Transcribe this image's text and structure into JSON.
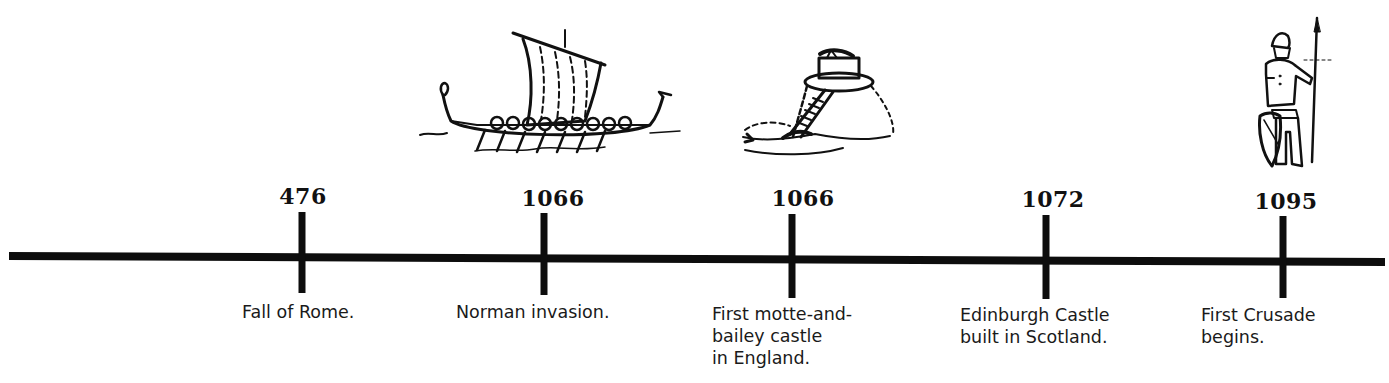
{
  "timeline": {
    "axis_color": "#0d0d0d",
    "events": [
      {
        "year": "476",
        "label": "Fall of Rome.",
        "illustration": null
      },
      {
        "year": "1066",
        "label": "Norman invasion.",
        "illustration": "viking-longship-icon"
      },
      {
        "year": "1066",
        "label": "First motte-and-\nbailey castle\nin England.",
        "illustration": "motte-and-bailey-castle-icon"
      },
      {
        "year": "1072",
        "label": "Edinburgh Castle\nbuilt in Scotland.",
        "illustration": null
      },
      {
        "year": "1095",
        "label": "First Crusade\nbegins.",
        "illustration": "crusader-knight-icon"
      }
    ]
  }
}
